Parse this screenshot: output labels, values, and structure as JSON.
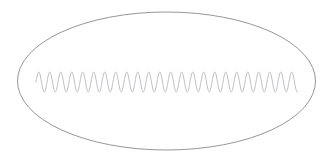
{
  "figure": {
    "background_color": "#ffffff",
    "width": 334,
    "height": 164,
    "ellipse": {
      "name": "outline-ellipse",
      "center_x": 166.5,
      "center_y": 81,
      "radius_x": 149,
      "radius_y": 69,
      "stroke_color": "#8a8a8e",
      "stroke_width": 0.9,
      "fill": "none"
    },
    "waveform": {
      "name": "sine-waveform",
      "shape": "sine",
      "x_start": 36,
      "x_end": 298,
      "baseline_y": 82,
      "amplitude": 10,
      "period": 11,
      "cycles": 24,
      "stroke_color": "#b9b9bf",
      "stroke_width": 0.9,
      "fill": "none",
      "samples_per_period": 24
    }
  }
}
